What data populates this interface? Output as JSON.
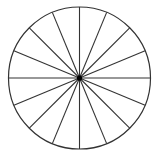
{
  "diagram": {
    "type": "circle-divided-into-sectors",
    "sectors": 16,
    "angle_step_deg": 22.5,
    "center": [
      79.5,
      78
    ],
    "radius": 71,
    "stroke_color": "#333333",
    "center_dot_color": "#000000",
    "background": "#ffffff"
  }
}
